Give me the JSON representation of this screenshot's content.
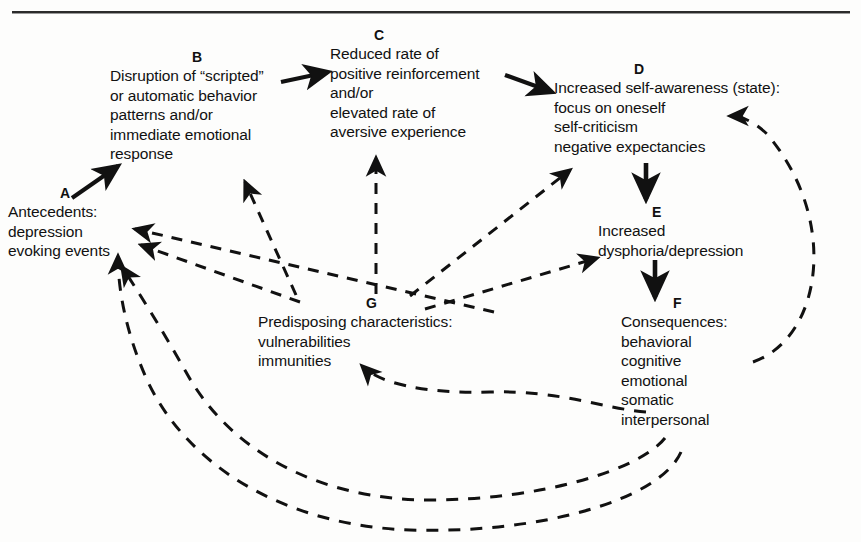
{
  "figure": {
    "title": "",
    "background_color": "#fdfdfc",
    "ink_color": "#111111"
  },
  "rule": {
    "name": "top-horizontal-rule"
  },
  "nodes": {
    "a": {
      "label": "A",
      "text": "Antecedents:\ndepression\nevoking events"
    },
    "b": {
      "label": "B",
      "text": "Disruption of “scripted”\nor automatic behavior\npatterns and/or\nimmediate emotional\nresponse"
    },
    "c": {
      "label": "C",
      "text": "Reduced rate of\npositive reinforcement\nand/or\nelevated rate of\naversive experience"
    },
    "d": {
      "label": "D",
      "text": "Increased self-awareness (state):\nfocus on oneself\nself-criticism\nnegative expectancies"
    },
    "e": {
      "label": "E",
      "text": "Increased\ndysphoria/depression"
    },
    "f": {
      "label": "F",
      "head": "Consequences:",
      "items": "behavioral\ncognitive\nemotional\nsomatic\ninterpersonal"
    },
    "g": {
      "label": "G",
      "text": "Predisposing characteristics:\nvulnerabilities\nimmunities"
    }
  },
  "edges": [
    {
      "name": "edge-a-to-b",
      "from": "A",
      "to": "B",
      "style": "solid"
    },
    {
      "name": "edge-b-to-c",
      "from": "B",
      "to": "C",
      "style": "solid"
    },
    {
      "name": "edge-c-to-d",
      "from": "C",
      "to": "D",
      "style": "solid"
    },
    {
      "name": "edge-d-to-e",
      "from": "D",
      "to": "E",
      "style": "solid"
    },
    {
      "name": "edge-e-to-f",
      "from": "E",
      "to": "F",
      "style": "solid"
    },
    {
      "name": "edge-f-to-d",
      "from": "F",
      "to": "D",
      "style": "dashed"
    },
    {
      "name": "edge-g-to-b",
      "from": "G",
      "to": "B",
      "style": "dashed"
    },
    {
      "name": "edge-g-to-c",
      "from": "G",
      "to": "C",
      "style": "dashed"
    },
    {
      "name": "edge-g-to-d",
      "from": "G",
      "to": "D",
      "style": "dashed"
    },
    {
      "name": "edge-g-to-e",
      "from": "G",
      "to": "E",
      "style": "dashed"
    },
    {
      "name": "edge-g-to-a",
      "from": "G",
      "to": "A",
      "style": "dashed"
    },
    {
      "name": "edge-f-to-a-upper",
      "from": "F",
      "to": "A",
      "style": "dashed"
    },
    {
      "name": "edge-f-to-g-curve",
      "from": "F",
      "to": "G",
      "style": "dashed"
    },
    {
      "name": "edge-f-to-a-lower",
      "from": "F",
      "to": "A",
      "style": "dashed"
    },
    {
      "name": "edge-f-to-b-curve",
      "from": "F",
      "to": "B",
      "style": "dashed"
    }
  ]
}
